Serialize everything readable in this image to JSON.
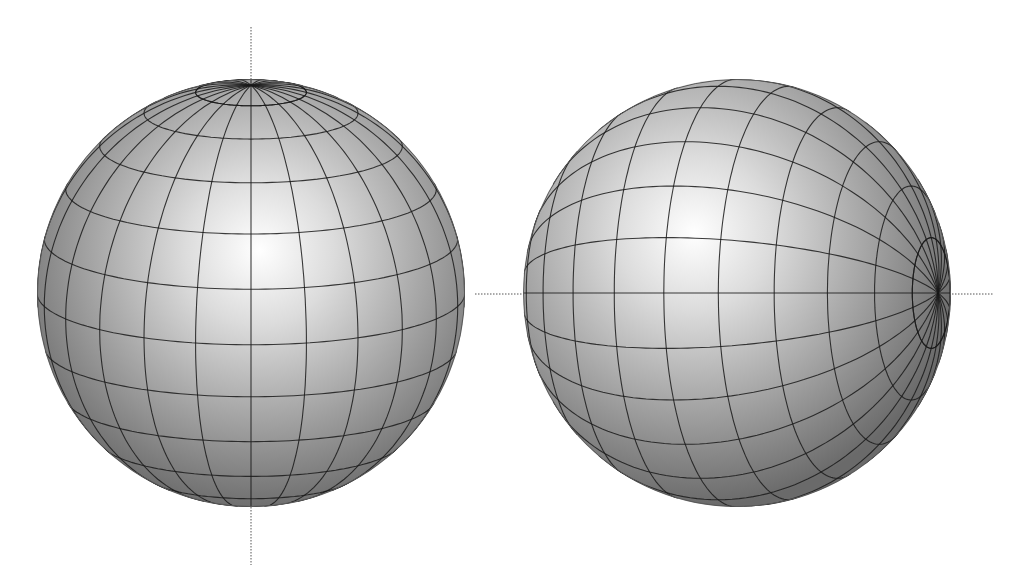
{
  "figure": {
    "background": "#ffffff",
    "grid_color": "#1a1a1a",
    "axis_color": "#555555",
    "shade_highlight": "#ffffff",
    "shade_mid": "#b8b8b8",
    "shade_dark": "#6e6e6e"
  },
  "spheres": [
    {
      "name": "sphere-polar-axis-vertical",
      "cx": 251,
      "cy": 293,
      "r": 214,
      "orientation": "vertical-pole",
      "meridians": 24,
      "parallels": 12,
      "tilt_deg": 14,
      "axis": {
        "x1": 251,
        "y1": 27,
        "x2": 251,
        "y2": 565,
        "style": "dotted"
      }
    },
    {
      "name": "sphere-polar-axis-horizontal",
      "cx": 737,
      "cy": 293,
      "r": 214,
      "orientation": "horizontal-pole",
      "meridians": 24,
      "parallels": 12,
      "tilt_deg": 20,
      "axis": {
        "x1": 475,
        "y1": 294,
        "x2": 993,
        "y2": 294,
        "style": "dotted"
      }
    }
  ]
}
